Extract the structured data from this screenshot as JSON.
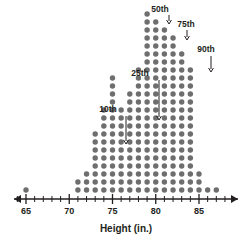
{
  "chart_data": {
    "type": "scatter",
    "plot_style": "dot-plot",
    "title": "",
    "xlabel": "Height (in.)",
    "ylabel": "",
    "xlim": [
      64,
      88
    ],
    "ylim": [
      0,
      24
    ],
    "grid": false,
    "legend": null,
    "tick_labels": [
      "65",
      "70",
      "75",
      "80",
      "85"
    ],
    "major_ticks": [
      65,
      70,
      75,
      80,
      85
    ],
    "minor_tick_step": 1,
    "dot_color": "#6e6e6e",
    "axis_color": "#231f20",
    "categories": [
      65,
      71,
      72,
      73,
      74,
      75,
      76,
      77,
      78,
      79,
      80,
      81,
      82,
      83,
      84,
      85,
      86,
      87
    ],
    "values": [
      1,
      2,
      3,
      8,
      11,
      15,
      11,
      13,
      16,
      23,
      22,
      21,
      20,
      18,
      16,
      3,
      1,
      1
    ],
    "annotations": [
      {
        "label": "10th",
        "percentile": 10,
        "x": 74,
        "label_x": 108,
        "label_y": 112,
        "arrow_x": 126,
        "arrow_y0": 116,
        "arrow_y1": 144
      },
      {
        "label": "25th",
        "percentile": 25,
        "x": 77,
        "label_x": 140,
        "label_y": 76,
        "arrow_x": 159,
        "arrow_y0": 80,
        "arrow_y1": 120
      },
      {
        "label": "50th",
        "percentile": 50,
        "x": 80,
        "label_x": 160,
        "label_y": 12,
        "arrow_x": 169,
        "arrow_y0": 15,
        "arrow_y1": 24
      },
      {
        "label": "75th",
        "percentile": 75,
        "x": 82,
        "label_x": 186,
        "label_y": 27,
        "arrow_x": 187,
        "arrow_y0": 30,
        "arrow_y1": 40
      },
      {
        "label": "90th",
        "percentile": 90,
        "x": 84,
        "label_x": 206,
        "label_y": 52,
        "arrow_x": 211,
        "arrow_y0": 56,
        "arrow_y1": 72
      }
    ]
  },
  "axis": {
    "title": "Height (in.)",
    "ticks": [
      {
        "value": "65"
      },
      {
        "value": "70"
      },
      {
        "value": "75"
      },
      {
        "value": "80"
      },
      {
        "value": "85"
      }
    ]
  },
  "annotations": {
    "p10": "10th",
    "p25": "25th",
    "p50": "50th",
    "p75": "75th",
    "p90": "90th"
  }
}
